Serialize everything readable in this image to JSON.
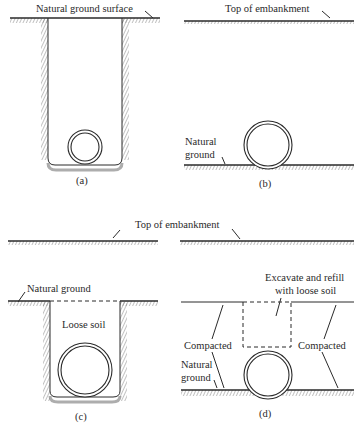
{
  "figure": {
    "panels": [
      {
        "id": "a",
        "caption": "(a)",
        "labels": [
          "Natural ground surface"
        ]
      },
      {
        "id": "b",
        "caption": "(b)",
        "labels": [
          "Top of embankment",
          "Natural",
          "ground"
        ]
      },
      {
        "id": "c",
        "caption": "(c)",
        "labels": [
          "Natural ground",
          "Loose soil"
        ]
      },
      {
        "id": "d",
        "caption": "(d)",
        "labels": [
          "Excavate and refill",
          "with loose soil",
          "Compacted",
          "Compacted",
          "Natural",
          "ground"
        ]
      }
    ],
    "shared_label": "Top of embankment"
  }
}
